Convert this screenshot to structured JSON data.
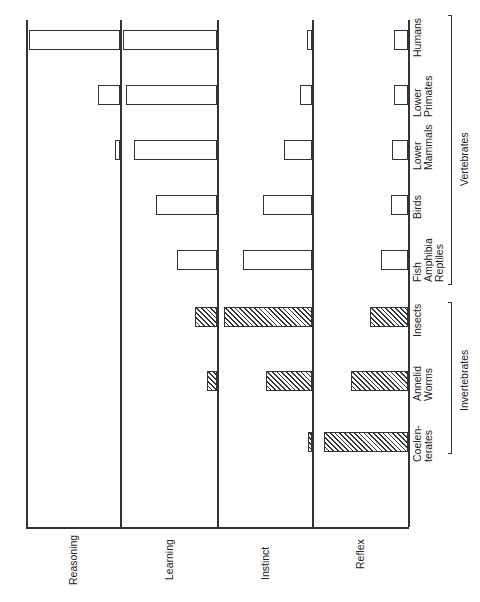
{
  "chart_data": {
    "type": "bar",
    "orientation": "rotated horizontal bars (figure rotated 90° counter-clockwise)",
    "title": "",
    "categories": [
      "Coelenterates",
      "Annelid Worms",
      "Insects",
      "Fish Amphibia Reptiles",
      "Birds",
      "Lower Mammals",
      "Lower Primates",
      "Humans"
    ],
    "category_labels": [
      [
        "Coelen-",
        "terates"
      ],
      [
        "Annelid",
        "Worms"
      ],
      [
        "Insects"
      ],
      [
        "Fish",
        "Amphibia",
        "Reptiles"
      ],
      [
        "Birds"
      ],
      [
        "Lower",
        "Mammals"
      ],
      [
        "Lower",
        "Primates"
      ],
      [
        "Humans"
      ]
    ],
    "groups": [
      {
        "label": "Invertebrates",
        "members": [
          "Coelenterates",
          "Annelid Worms",
          "Insects"
        ],
        "pattern": "hatched"
      },
      {
        "label": "Vertebrates",
        "members": [
          "Fish Amphibia Reptiles",
          "Birds",
          "Lower Mammals",
          "Lower Primates",
          "Humans"
        ],
        "pattern": "open"
      }
    ],
    "series": [
      {
        "name": "Reasoning",
        "values": [
          0,
          0,
          0,
          0,
          0,
          5,
          23,
          97
        ]
      },
      {
        "name": "Learning",
        "values": [
          0,
          10,
          23,
          41,
          63,
          86,
          94,
          97
        ]
      },
      {
        "name": "Instinct",
        "values": [
          4,
          48,
          93,
          73,
          52,
          29,
          13,
          5
        ]
      },
      {
        "name": "Reflex",
        "values": [
          87,
          59,
          40,
          28,
          18,
          17,
          15,
          15
        ]
      }
    ],
    "units": "relative (0-100 % of panel width)",
    "xlabel": "",
    "ylabel": "",
    "grid": false,
    "legend": "none (panel labels: Reasoning, Learning, Instinct, Reflex)"
  },
  "labels": {
    "panels": [
      "Reasoning",
      "Learning",
      "Instinct",
      "Reflex"
    ],
    "categories": [
      [
        "Coelen-",
        "terates"
      ],
      [
        "Annelid",
        "Worms"
      ],
      [
        "Insects"
      ],
      [
        "Fish",
        "Amphibia",
        "Reptiles"
      ],
      [
        "Birds"
      ],
      [
        "Lower",
        "Mammals"
      ],
      [
        "Lower",
        "Primates"
      ],
      [
        "Humans"
      ]
    ],
    "groups": [
      "Invertebrates",
      "Vertebrates"
    ]
  }
}
